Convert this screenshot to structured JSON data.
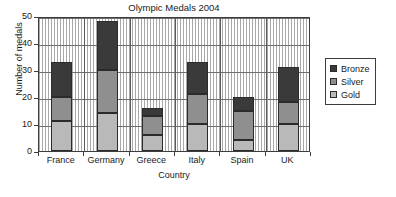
{
  "chart_data": {
    "type": "bar",
    "subtype": "stacked-vertical",
    "title": "Olympic Medals 2004",
    "xlabel": "Country",
    "ylabel": "Number of medals",
    "categories": [
      "France",
      "Germany",
      "Greece",
      "Italy",
      "Spain",
      "UK"
    ],
    "series": [
      {
        "name": "Gold",
        "color": "#b9b9b9",
        "values": [
          11,
          14,
          6,
          10,
          4,
          10
        ]
      },
      {
        "name": "Silver",
        "color": "#8f8f8f",
        "values": [
          9,
          16,
          7,
          11,
          11,
          8
        ]
      },
      {
        "name": "Bronze",
        "color": "#3a3a3a",
        "values": [
          13,
          18,
          3,
          12,
          5,
          13
        ]
      }
    ],
    "stack_totals": [
      33,
      48,
      16,
      33,
      20,
      31
    ],
    "ylim": [
      0,
      50
    ],
    "yticks": [
      0,
      10,
      20,
      30,
      40,
      50
    ],
    "ytick_labels": [
      "0",
      "10",
      "20",
      "30",
      "40",
      "50"
    ],
    "grid": true,
    "grid_style": "dotted-minor-with-solid-major",
    "legend_position": "right-outside",
    "legend_entries": [
      "Bronze",
      "Silver",
      "Gold"
    ]
  },
  "legend": {
    "items": [
      {
        "label": "Bronze",
        "color": "#3a3a3a"
      },
      {
        "label": "Silver",
        "color": "#8f8f8f"
      },
      {
        "label": "Gold",
        "color": "#b9b9b9"
      }
    ]
  }
}
